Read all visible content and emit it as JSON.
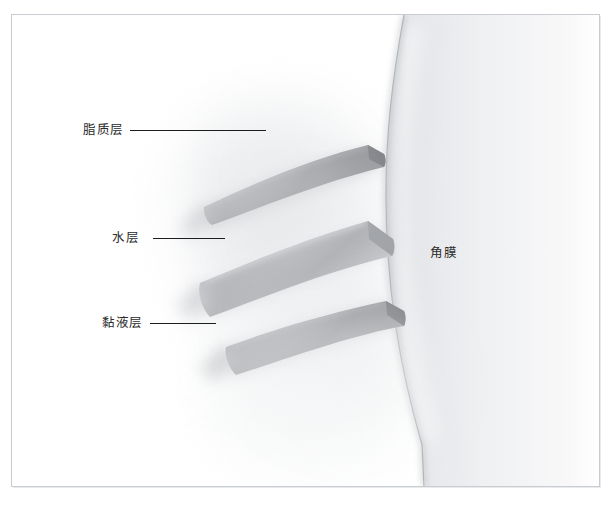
{
  "figure": {
    "title": "",
    "background_color": "#ffffff",
    "frame_color": "#c9ccd1"
  },
  "labels": {
    "lipid": "脂质层",
    "aqueous": "水层",
    "mucin": "黏液层",
    "cornea": "角膜"
  },
  "illustration": {
    "name": "tear-film-layers-diagram",
    "colors": {
      "lipid_band": "#8f9094",
      "aqueous_band": "#b9bbbe",
      "mucin_band": "#9a9c9f",
      "cornea_body": "#e3e5e8",
      "cornea_edge": "#c4c7cb",
      "haze": "#eceef0"
    }
  }
}
